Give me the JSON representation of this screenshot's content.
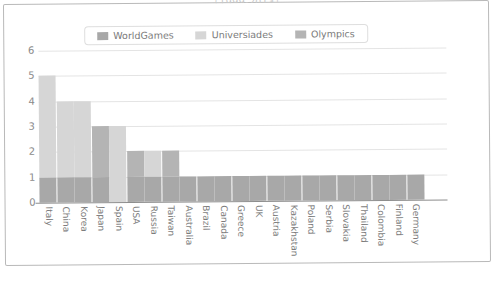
{
  "chart_data": {
    "type": "bar",
    "subtype": "stacked-bar",
    "title": "（1999-2013）",
    "xlabel": "",
    "ylabel": "",
    "ylim": [
      0,
      6
    ],
    "yticks": [
      0,
      1,
      2,
      3,
      4,
      5,
      6
    ],
    "grid": true,
    "legend_position": "top-center",
    "categories": [
      "Italy",
      "China",
      "Korea",
      "Japan",
      "Spain",
      "USA",
      "Russia",
      "Taiwan",
      "Australia",
      "Brazil",
      "Canada",
      "Greece",
      "UK",
      "Austria",
      "Kazakhstan",
      "Poland",
      "Serbia",
      "Slovakia",
      "Thailand",
      "Colombia",
      "Finland",
      "Germany"
    ],
    "series": [
      {
        "name": "WorldGames",
        "color": "#a8a8a8",
        "values": [
          1,
          1,
          1,
          1,
          0,
          1,
          1,
          1,
          1,
          1,
          1,
          1,
          1,
          1,
          1,
          1,
          1,
          1,
          1,
          1,
          1,
          1
        ]
      },
      {
        "name": "Universiades",
        "color": "#d6d6d6",
        "values": [
          4,
          3,
          3,
          0,
          3,
          0,
          1,
          0,
          0,
          0,
          0,
          0,
          0,
          0,
          0,
          0,
          0,
          0,
          0,
          0,
          0,
          0
        ]
      },
      {
        "name": "Olympics",
        "color": "#b4b4b4",
        "values": [
          0,
          0,
          0,
          2,
          0,
          1,
          0,
          1,
          0,
          0,
          0,
          0,
          0,
          0,
          0,
          0,
          0,
          0,
          0,
          0,
          0,
          0
        ]
      }
    ],
    "totals": [
      5,
      4,
      4,
      3,
      3,
      2,
      2,
      2,
      1,
      1,
      1,
      1,
      1,
      1,
      1,
      1,
      1,
      1,
      1,
      1,
      1,
      1
    ]
  },
  "legend": {
    "items": [
      {
        "label": "WorldGames",
        "color": "#a8a8a8"
      },
      {
        "label": "Universiades",
        "color": "#d6d6d6"
      },
      {
        "label": "Olympics",
        "color": "#b4b4b4"
      }
    ]
  }
}
